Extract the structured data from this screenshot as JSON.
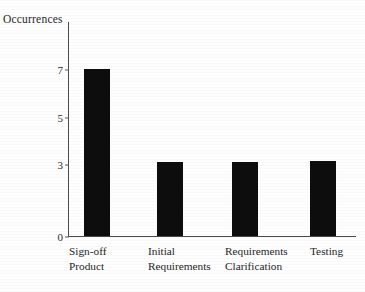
{
  "chart_data": {
    "type": "bar",
    "title": "",
    "xlabel": "",
    "ylabel": "Occurrences",
    "categories": [
      "Sign-off\nProduct",
      "Initial\nRequirements",
      "Requirements\nClarification",
      "Testing"
    ],
    "values": [
      7,
      3.1,
      3.1,
      3.15
    ],
    "ytick_labels": [
      "0",
      "3",
      "5",
      "7"
    ],
    "ytick_values": [
      0,
      3,
      5,
      7
    ],
    "ylim": [
      0,
      9
    ],
    "grid": false,
    "legend": null,
    "bar_color": "#0d0d0d",
    "axis_color": "#4a4a4a",
    "background": "#ffffff"
  },
  "axis": {
    "y_title": "Occurrences"
  }
}
